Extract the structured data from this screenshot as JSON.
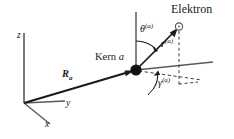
{
  "figure": {
    "type": "diagram",
    "background_color": "#ffffff",
    "line_color": "#1a1a1a",
    "width": 234,
    "height": 139,
    "labels": {
      "electron": "Elektron",
      "nucleus": "Kern",
      "nucleus_index": "a",
      "axis_z": "z",
      "axis_y": "y",
      "axis_x": "x",
      "vector_R": "R",
      "vector_R_sub": "a",
      "angle_theta": "θ",
      "angle_theta_sup": "(a)",
      "radius_r": "r",
      "radius_r_sup": "(a)",
      "angle_gamma": "γ",
      "angle_gamma_sup": "(a)"
    },
    "geometry": {
      "origin": [
        24,
        103
      ],
      "nucleus": [
        136,
        70
      ],
      "electron": [
        178,
        27
      ],
      "z_axis_tip": [
        24,
        33
      ],
      "y_axis_tip": [
        64,
        101
      ],
      "x_axis_tip": [
        49,
        124
      ],
      "local_z_tip": [
        136,
        12
      ],
      "local_horizontal_tip": [
        213,
        62
      ],
      "projection_point": [
        178,
        62
      ],
      "dashed_plane_tip": [
        202,
        80
      ]
    }
  }
}
